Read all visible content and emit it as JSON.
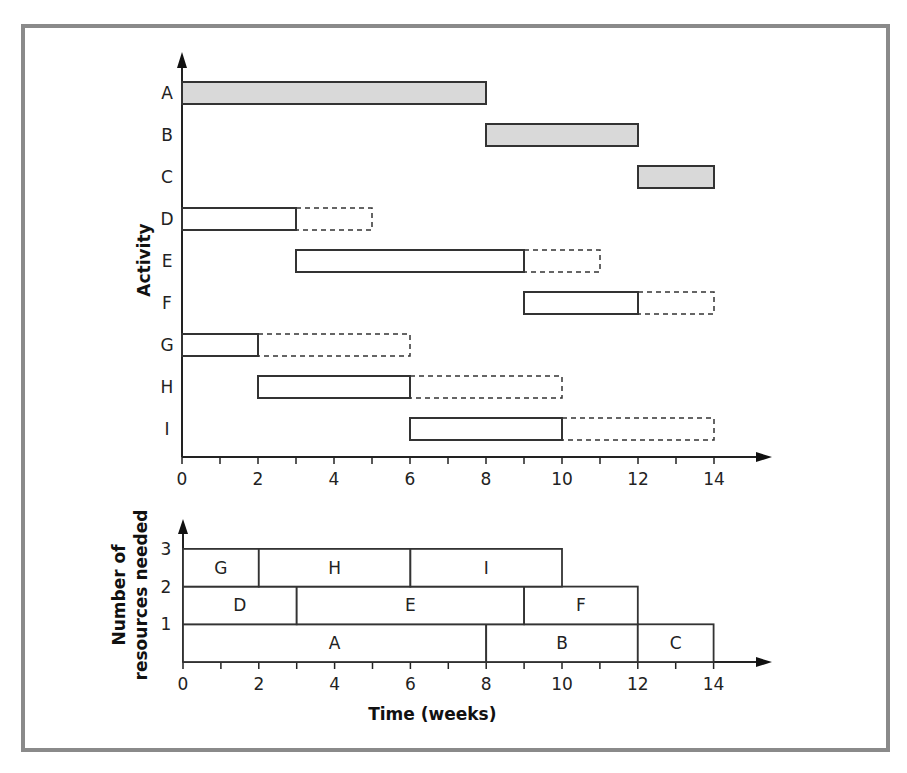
{
  "chart_data": [
    {
      "type": "gantt",
      "title": "",
      "xlabel": "Time (weeks)",
      "ylabel": "Activity",
      "xlim": [
        0,
        14
      ],
      "x_ticks": [
        0,
        2,
        4,
        6,
        8,
        10,
        12,
        14
      ],
      "minor_tick_step": 1,
      "activities": [
        {
          "name": "A",
          "start": 0,
          "end": 8,
          "float_end": 8,
          "critical": true
        },
        {
          "name": "B",
          "start": 8,
          "end": 12,
          "float_end": 12,
          "critical": true
        },
        {
          "name": "C",
          "start": 12,
          "end": 14,
          "float_end": 14,
          "critical": true
        },
        {
          "name": "D",
          "start": 0,
          "end": 3,
          "float_end": 5,
          "critical": false
        },
        {
          "name": "E",
          "start": 3,
          "end": 9,
          "float_end": 11,
          "critical": false
        },
        {
          "name": "F",
          "start": 9,
          "end": 12,
          "float_end": 14,
          "critical": false
        },
        {
          "name": "G",
          "start": 0,
          "end": 2,
          "float_end": 6,
          "critical": false
        },
        {
          "name": "H",
          "start": 2,
          "end": 6,
          "float_end": 10,
          "critical": false
        },
        {
          "name": "I",
          "start": 6,
          "end": 10,
          "float_end": 14,
          "critical": false
        }
      ],
      "critical_fill": "#d9d9d9"
    },
    {
      "type": "resource_histogram",
      "title": "",
      "xlabel": "Time (weeks)",
      "ylabel": "Number of resources needed",
      "ylabel_lines": [
        "Number of",
        "resources needed"
      ],
      "xlim": [
        0,
        14
      ],
      "ylim": [
        0,
        3
      ],
      "x_ticks": [
        0,
        2,
        4,
        6,
        8,
        10,
        12,
        14
      ],
      "y_ticks": [
        1,
        2,
        3
      ],
      "blocks": [
        {
          "name": "A",
          "start": 0,
          "end": 8,
          "level": 0
        },
        {
          "name": "B",
          "start": 8,
          "end": 12,
          "level": 0
        },
        {
          "name": "C",
          "start": 12,
          "end": 14,
          "level": 0
        },
        {
          "name": "D",
          "start": 0,
          "end": 3,
          "level": 1
        },
        {
          "name": "E",
          "start": 3,
          "end": 9,
          "level": 1
        },
        {
          "name": "F",
          "start": 9,
          "end": 12,
          "level": 1
        },
        {
          "name": "G",
          "start": 0,
          "end": 2,
          "level": 2
        },
        {
          "name": "H",
          "start": 2,
          "end": 6,
          "level": 2
        },
        {
          "name": "I",
          "start": 6,
          "end": 10,
          "level": 2
        }
      ]
    }
  ]
}
